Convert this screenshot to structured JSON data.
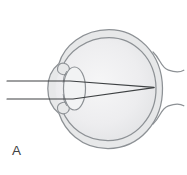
{
  "figure": {
    "panel_label": "A"
  },
  "icons": {
    "illustration": "eye-cross-section-with-converging-light-rays"
  },
  "colors": {
    "background": "#ffffff",
    "outline": "#8d9195",
    "sclera_fill": "#e7e8e9",
    "vitreous_center": "#f6f6f7",
    "vitreous_edge": "#e3e4e6",
    "lens_fill": "#f2f3f4",
    "ray": "#3e4143",
    "label": "#3f4143"
  }
}
